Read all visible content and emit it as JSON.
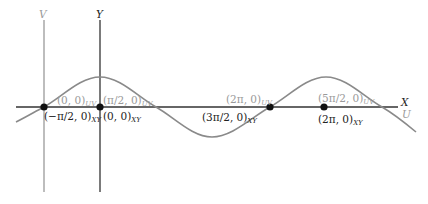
{
  "axes": {
    "x_label": "X",
    "y_label": "Y",
    "u_label": "U",
    "v_label": "V"
  },
  "colors": {
    "primary_axis": "#333333",
    "secondary_axis": "#9a9a9a",
    "curve": "#8a8a8a",
    "point": "#111111",
    "label_dark": "#222222",
    "label_gray": "#9a9a9a"
  },
  "points": [
    {
      "id": "p1",
      "xy_label": "(−π/2, 0)",
      "xy_sub": "XY",
      "uv_label": "(0, 0)",
      "uv_sub": "UV"
    },
    {
      "id": "p2",
      "xy_label": "(0, 0)",
      "xy_sub": "XY",
      "uv_label": "(π/2, 0)",
      "uv_sub": "UV"
    },
    {
      "id": "p3",
      "xy_label": "(3π/2, 0)",
      "xy_sub": "XY",
      "uv_label": "(2π, 0)",
      "uv_sub": "UV"
    },
    {
      "id": "p4",
      "xy_label": "(2π, 0)",
      "xy_sub": "XY",
      "uv_label": "(5π/2, 0)",
      "uv_sub": "UV"
    }
  ],
  "curve": {
    "type": "sine",
    "description": "cosine in XY frame / sine in UV frame"
  }
}
